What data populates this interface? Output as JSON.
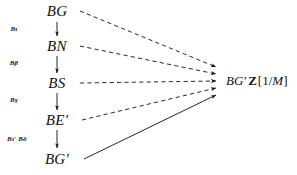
{
  "figure": {
    "type": "commutative-diagram",
    "background_color": "#ffffff",
    "ink_color": "#111111"
  },
  "nodes": [
    {
      "id": "BG",
      "label": "BG",
      "x": 57,
      "y": 11
    },
    {
      "id": "BN",
      "label": "BN",
      "x": 57,
      "y": 46
    },
    {
      "id": "BS",
      "label": "BS",
      "x": 57,
      "y": 83
    },
    {
      "id": "BEp",
      "label": "BE′",
      "x": 57,
      "y": 120
    },
    {
      "id": "BGp",
      "label": "BG′",
      "x": 57,
      "y": 159
    }
  ],
  "vertical_arrows": [
    {
      "id": "arrow-bg-bn",
      "label": "Bι",
      "label_x": 14,
      "label_y": 29,
      "from_x": 57,
      "from_y": 22,
      "to_x": 57,
      "to_y": 36
    },
    {
      "id": "arrow-bn-bs",
      "label": "Bβ",
      "label_x": 14,
      "label_y": 63,
      "from_x": 57,
      "from_y": 56,
      "to_x": 57,
      "to_y": 73
    },
    {
      "id": "arrow-bs-bep",
      "label": "Bγ",
      "label_x": 14,
      "label_y": 100,
      "from_x": 57,
      "from_y": 93,
      "to_x": 57,
      "to_y": 110
    },
    {
      "id": "arrow-bep-bgp",
      "label": "Bι′ Bδ",
      "label_x": 17,
      "label_y": 139,
      "from_x": 57,
      "from_y": 130,
      "to_x": 57,
      "to_y": 148
    }
  ],
  "convergent_arrows": [
    {
      "id": "edge-bg-target",
      "style": "dashed",
      "from_x": 80,
      "from_y": 11,
      "to_x": 218,
      "to_y": 67
    },
    {
      "id": "edge-bn-target",
      "style": "dashed",
      "from_x": 80,
      "from_y": 46,
      "to_x": 218,
      "to_y": 74
    },
    {
      "id": "edge-bs-target",
      "style": "dashed",
      "from_x": 80,
      "from_y": 83,
      "to_x": 218,
      "to_y": 81
    },
    {
      "id": "edge-bep-target",
      "style": "dashed",
      "from_x": 82,
      "from_y": 120,
      "to_x": 218,
      "to_y": 88
    },
    {
      "id": "edge-bgp-target",
      "style": "solid",
      "from_x": 84,
      "from_y": 159,
      "to_x": 218,
      "to_y": 95
    }
  ],
  "target": {
    "id": "target-object",
    "full_label": "BG′ Z[1/M]",
    "ring_part": "BG′",
    "bold_part": "Z",
    "bracket_open": "[1/",
    "bracket_var": "M",
    "bracket_close": "]",
    "x": 226,
    "y": 81
  }
}
